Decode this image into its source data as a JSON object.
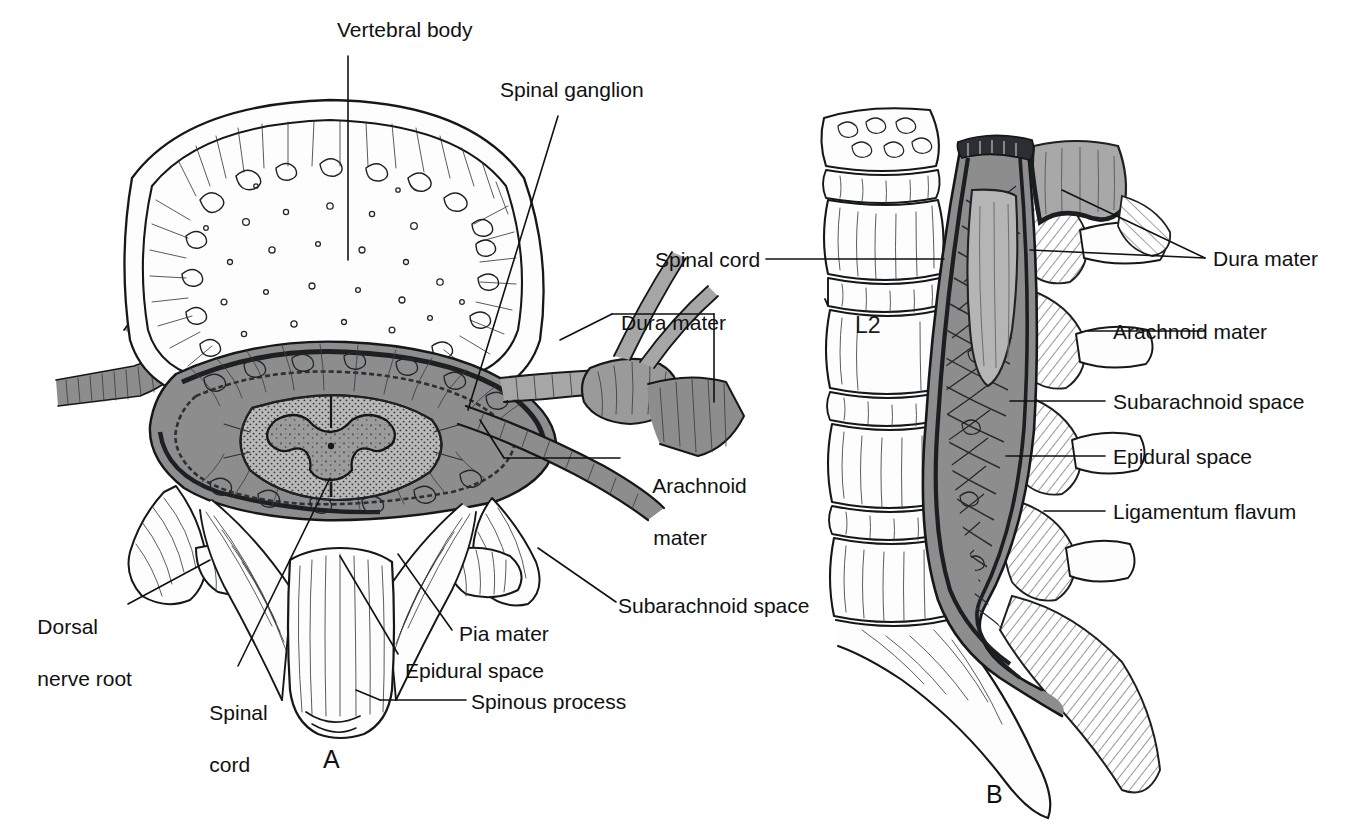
{
  "figure": {
    "background_color": "#ffffff",
    "ink_color": "#15181a",
    "tissue_gray": "#8d8d8d",
    "label_font_size_px": 21
  },
  "panels": [
    {
      "id": "A",
      "letter": "A",
      "caption": "Transverse (cross) section of a lumbar vertebra with spinal cord and meninges"
    },
    {
      "id": "B",
      "letter": "B",
      "caption": "Midsagittal section of the lumbar spine showing the spinal cord, cauda equina and meninges"
    }
  ],
  "panel_a": {
    "letter": "A",
    "labels": [
      {
        "key": "vertebral_body",
        "text": "Vertebral body",
        "lines": [
          "Vertebral body"
        ]
      },
      {
        "key": "spinal_ganglion",
        "text": "Spinal ganglion",
        "lines": [
          "Spinal ganglion"
        ]
      },
      {
        "key": "dura_mater",
        "text": "Dura mater",
        "lines": [
          "Dura mater"
        ]
      },
      {
        "key": "arachnoid_mater",
        "text": "Arachnoid mater",
        "lines": [
          "Arachnoid",
          "mater"
        ]
      },
      {
        "key": "subarachnoid_space",
        "text": "Subarachnoid space",
        "lines": [
          "Subarachnoid space"
        ]
      },
      {
        "key": "dorsal_nerve_root",
        "text": "Dorsal nerve root",
        "lines": [
          "Dorsal",
          "nerve root"
        ]
      },
      {
        "key": "spinal_cord",
        "text": "Spinal cord",
        "lines": [
          "Spinal",
          "cord"
        ]
      },
      {
        "key": "pia_mater",
        "text": "Pia mater",
        "lines": [
          "Pia mater"
        ]
      },
      {
        "key": "epidural_space",
        "text": "Epidural space",
        "lines": [
          "Epidural space"
        ]
      },
      {
        "key": "spinous_process",
        "text": "Spinous process",
        "lines": [
          "Spinous process"
        ]
      }
    ]
  },
  "panel_b": {
    "letter": "B",
    "vertebra_mark": "L2",
    "labels": [
      {
        "key": "spinal_cord",
        "text": "Spinal cord",
        "lines": [
          "Spinal cord"
        ]
      },
      {
        "key": "dura_mater",
        "text": "Dura mater",
        "lines": [
          "Dura mater"
        ]
      },
      {
        "key": "arachnoid_mater",
        "text": "Arachnoid mater",
        "lines": [
          "Arachnoid mater"
        ]
      },
      {
        "key": "subarachnoid_space",
        "text": "Subarachnoid space",
        "lines": [
          "Subarachnoid space"
        ]
      },
      {
        "key": "epidural_space",
        "text": "Epidural space",
        "lines": [
          "Epidural space"
        ]
      },
      {
        "key": "ligamentum_flavum",
        "text": "Ligamentum flavum",
        "lines": [
          "Ligamentum flavum"
        ]
      }
    ]
  }
}
